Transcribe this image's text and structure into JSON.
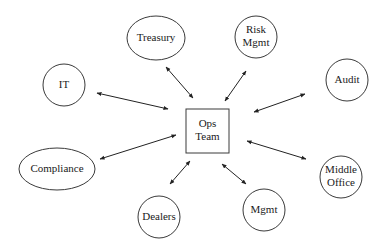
{
  "diagram": {
    "type": "hub-and-spoke",
    "colors": {
      "stroke": "#3a3a3a",
      "text": "#1a1a1a",
      "background": "#ffffff"
    },
    "center": {
      "id": "ops",
      "lines": [
        "Ops",
        "Team"
      ],
      "shape": "rect",
      "x": 186,
      "y": 109,
      "w": 43,
      "h": 44
    },
    "nodes": [
      {
        "id": "treasury",
        "lines": [
          "Treasury"
        ],
        "shape": "ellipse",
        "cx": 156,
        "cy": 38,
        "rx": 29,
        "ry": 22,
        "edge": {
          "x1": 166,
          "y1": 67,
          "x2": 193,
          "y2": 98
        }
      },
      {
        "id": "risk",
        "lines": [
          "Risk",
          "Mgmt"
        ],
        "shape": "circle",
        "cx": 256,
        "cy": 37,
        "rx": 21,
        "ry": 21,
        "edge": {
          "x1": 246,
          "y1": 71,
          "x2": 225,
          "y2": 101
        }
      },
      {
        "id": "it",
        "lines": [
          "IT"
        ],
        "shape": "circle",
        "cx": 64,
        "cy": 85,
        "rx": 21,
        "ry": 21,
        "edge": {
          "x1": 97,
          "y1": 93,
          "x2": 168,
          "y2": 109
        }
      },
      {
        "id": "audit",
        "lines": [
          "Audit"
        ],
        "shape": "circle",
        "cx": 347,
        "cy": 80,
        "rx": 21,
        "ry": 21,
        "edge": {
          "x1": 305,
          "y1": 94,
          "x2": 254,
          "y2": 112
        }
      },
      {
        "id": "compliance",
        "lines": [
          "Compliance"
        ],
        "shape": "ellipse",
        "cx": 57,
        "cy": 169,
        "rx": 38,
        "ry": 21,
        "edge": {
          "x1": 100,
          "y1": 159,
          "x2": 176,
          "y2": 135
        }
      },
      {
        "id": "middle-office",
        "lines": [
          "Middle",
          "Office"
        ],
        "shape": "circle",
        "cx": 341,
        "cy": 177,
        "rx": 21,
        "ry": 21,
        "edge": {
          "x1": 247,
          "y1": 141,
          "x2": 306,
          "y2": 159
        }
      },
      {
        "id": "dealers",
        "lines": [
          "Dealers"
        ],
        "shape": "circle",
        "cx": 159,
        "cy": 217,
        "rx": 21,
        "ry": 21,
        "edge": {
          "x1": 170,
          "y1": 184,
          "x2": 190,
          "y2": 161
        }
      },
      {
        "id": "mgmt",
        "lines": [
          "Mgmt"
        ],
        "shape": "circle",
        "cx": 264,
        "cy": 210,
        "rx": 21,
        "ry": 21,
        "edge": {
          "x1": 222,
          "y1": 164,
          "x2": 246,
          "y2": 184
        }
      }
    ]
  }
}
